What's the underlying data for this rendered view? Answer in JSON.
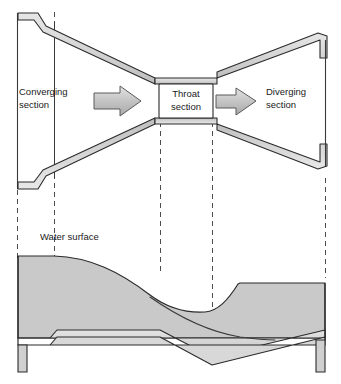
{
  "figure": {
    "width": 341,
    "height": 384,
    "background_color": "#ffffff"
  },
  "colors": {
    "wall_fill": "#d2d2d2",
    "water_fill": "#c9c9c9",
    "arrow_fill": "#bdbdbd",
    "outline": "#2b2b2b",
    "thin_line": "#3a3a3a",
    "dashed_line": "#4d4d4d",
    "text": "#1a1a1a",
    "throat_box_fill": "#ffffff"
  },
  "plan_view": {
    "labels": {
      "converging_line1": "Converging",
      "converging_line2": "section",
      "throat_line1": "Throat",
      "throat_line2": "section",
      "diverging_line1": "Diverging",
      "diverging_line2": "section"
    },
    "flow_arrows": [
      {
        "name": "upstream-flow-arrow",
        "direction": "right"
      },
      {
        "name": "downstream-flow-arrow",
        "direction": "right"
      }
    ]
  },
  "profile_view": {
    "labels": {
      "water_surface": "Water surface"
    }
  },
  "section_markers": {
    "count": 5,
    "x_positions": [
      17,
      54,
      160,
      212,
      325
    ],
    "style": "dashed vertical"
  }
}
